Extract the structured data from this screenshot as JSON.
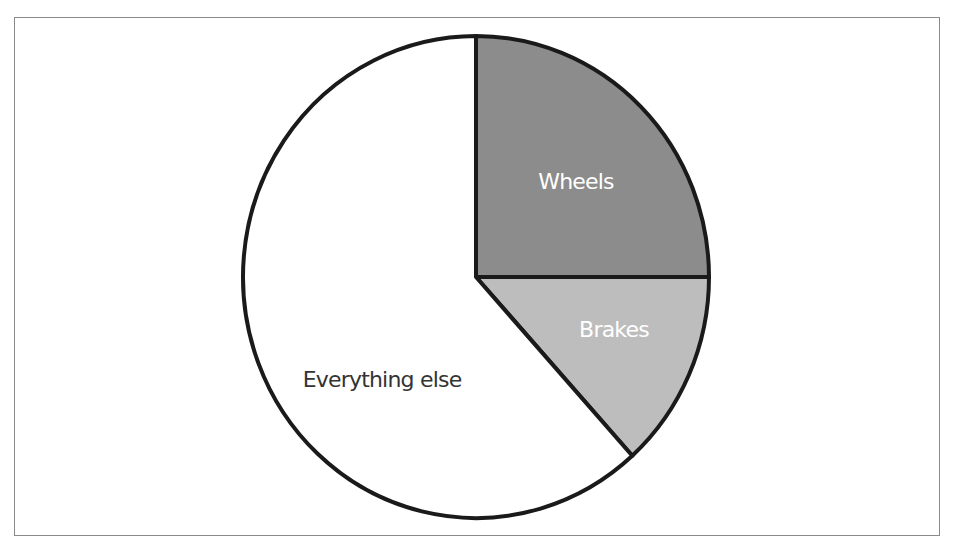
{
  "chart_data": {
    "type": "pie",
    "title": "",
    "categories": [
      "Wheels",
      "Brakes",
      "Everything else"
    ],
    "values": [
      25,
      13.3,
      61.7
    ],
    "unit": "percent (estimated from slice angles)",
    "start_angle_deg": 90,
    "direction": "clockwise",
    "colors": {
      "Wheels": "#8c8c8c",
      "Brakes": "#bdbdbd",
      "Everything else": "#ffffff"
    },
    "label_colors": {
      "Wheels": "#ffffff",
      "Brakes": "#ffffff",
      "Everything else": "#333333"
    },
    "legend": "none (labels drawn inside slices)",
    "grid": false
  },
  "labels": {
    "wheels": "Wheels",
    "brakes": "Brakes",
    "everything_else": "Everything else"
  },
  "style": {
    "stroke": "#1a1a1a",
    "frame_border": "#8a8a8a"
  }
}
